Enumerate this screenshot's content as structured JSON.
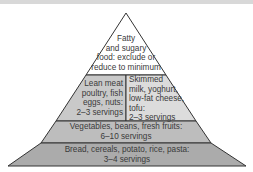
{
  "diagram": {
    "type": "food-pyramid",
    "colors": {
      "tier_top": "#ffffff",
      "tier_mid_left": "#c9c9c9",
      "tier_mid_right": "#dcdcdc",
      "tier_veg": "#bdbdbd",
      "tier_base": "#ababab",
      "outline": "#333333"
    },
    "tiers": [
      {
        "id": "fats",
        "lines": [
          "Fatty",
          "and sugary",
          "food: exclude or",
          "reduce to minimum"
        ]
      },
      {
        "id": "protein",
        "lines": [
          "Lean meat",
          "poultry, fish",
          "eggs, nuts:",
          "2–3 servings"
        ]
      },
      {
        "id": "dairy",
        "lines": [
          "Skimmed",
          "milk, yoghurt,",
          "low-fat cheese,",
          "tofu:",
          "2–3 servings"
        ]
      },
      {
        "id": "vegetables",
        "lines": [
          "Vegetables, beans, fresh fruits:",
          "6–10 servings"
        ]
      },
      {
        "id": "grains",
        "lines": [
          "Bread, cereals, potato, rice, pasta:",
          "3–4 servings"
        ]
      }
    ]
  }
}
